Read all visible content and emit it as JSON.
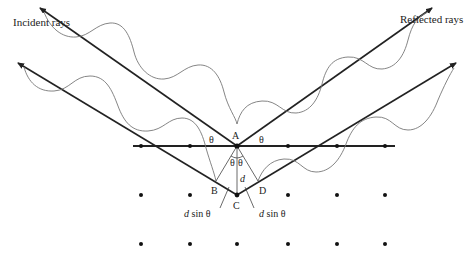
{
  "diagram": {
    "labels": {
      "incident": "Incident rays",
      "reflected": "Reflected rays",
      "point_a": "A",
      "point_b": "B",
      "point_c": "C",
      "point_d": "D",
      "spacing": "d",
      "theta": "θ",
      "path_left_d": "d",
      "path_left_rest": " sin θ",
      "path_right_d": "d",
      "path_right_rest": " sin θ"
    },
    "lattice": {
      "rows_y": [
        146,
        195,
        244
      ],
      "columns_x": [
        141,
        190,
        237,
        288,
        337,
        385
      ]
    },
    "colors": {
      "ray": "#222222",
      "wave": "#777777",
      "dot": "#111111"
    }
  }
}
